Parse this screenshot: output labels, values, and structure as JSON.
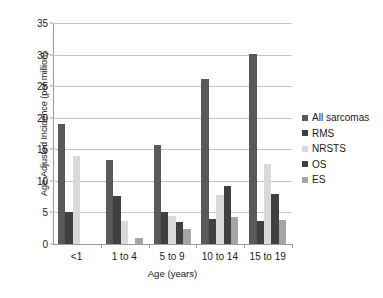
{
  "chart_data": {
    "type": "bar",
    "title": "",
    "xlabel": "Age (years)",
    "ylabel": "Age-Adjusted Incidence (per million)",
    "categories": [
      "<1",
      "1 to 4",
      "5 to 9",
      "10 to 14",
      "15 to 19"
    ],
    "series": [
      {
        "name": "All sarcomas",
        "color": "#595959",
        "values": [
          19.0,
          13.3,
          15.7,
          26.1,
          30.1
        ]
      },
      {
        "name": "RMS",
        "color": "#404040",
        "values": [
          5.0,
          7.6,
          5.0,
          4.0,
          3.6
        ]
      },
      {
        "name": "NRSTS",
        "color": "#d9d9d9",
        "values": [
          14.0,
          3.6,
          4.4,
          7.8,
          12.6
        ]
      },
      {
        "name": "OS",
        "color": "#404040",
        "values": [
          0.0,
          0.0,
          3.5,
          9.2,
          8.0
        ]
      },
      {
        "name": "ES",
        "color": "#a6a6a6",
        "values": [
          0.0,
          1.0,
          2.4,
          4.3,
          3.8
        ]
      }
    ],
    "ylim": [
      0,
      35
    ],
    "yticks": [
      0,
      5,
      10,
      15,
      20,
      25,
      30,
      35
    ],
    "ytick_labels": [
      "0",
      "5",
      "10",
      "15",
      "20",
      "25",
      "30",
      "35"
    ],
    "grid": true,
    "legend_position": "right"
  },
  "legend": {
    "entries": [
      {
        "label": "All sarcomas"
      },
      {
        "label": "RMS"
      },
      {
        "label": "NRSTS"
      },
      {
        "label": "OS"
      },
      {
        "label": "ES"
      }
    ]
  }
}
